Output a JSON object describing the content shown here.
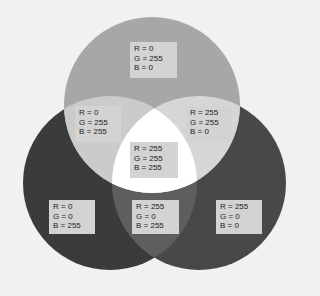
{
  "diagram": {
    "type": "venn",
    "title": "",
    "colors": {
      "background": "#f1f1f1",
      "green_only": "#a7a7a7",
      "blue_only": "#3b3b3b",
      "red_only": "#484848",
      "cyan_overlap": "#cbcbcb",
      "yellow_overlap": "#d6d6d6",
      "magenta_overlap": "#5e5e5e",
      "white_center": "#ffffff",
      "label_box": "#d3d3d3"
    },
    "circles": [
      {
        "name": "green",
        "cx": 152,
        "cy": 105,
        "r": 88
      },
      {
        "name": "blue",
        "cx": 110,
        "cy": 183,
        "r": 87
      },
      {
        "name": "red",
        "cx": 199,
        "cy": 183,
        "r": 87
      }
    ],
    "regions": [
      {
        "id": "green",
        "lines": [
          "R = 0",
          "G = 255",
          "B = 0"
        ]
      },
      {
        "id": "cyan",
        "lines": [
          "R = 0",
          "G = 255",
          "B = 255"
        ]
      },
      {
        "id": "yellow",
        "lines": [
          "R = 255",
          "G = 255",
          "B = 0"
        ]
      },
      {
        "id": "white",
        "lines": [
          "R = 255",
          "G = 255",
          "B = 255"
        ]
      },
      {
        "id": "blue",
        "lines": [
          "R = 0",
          "G = 0",
          "B = 255"
        ]
      },
      {
        "id": "magenta",
        "lines": [
          "R = 255",
          "G = 0",
          "B = 255"
        ]
      },
      {
        "id": "red",
        "lines": [
          "R = 255",
          "G = 0",
          "B = 0"
        ]
      }
    ]
  }
}
